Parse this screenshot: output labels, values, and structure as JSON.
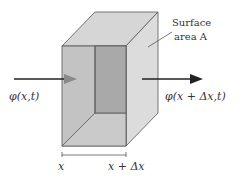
{
  "diagram": {
    "labels": {
      "surface_line1": "Surface",
      "surface_line2": "area A",
      "flux_in": "φ(x,t)",
      "flux_out": "φ(x + Δx,t)",
      "x_left": "x",
      "x_right": "x + Δx"
    },
    "colors": {
      "front_face": "#c3c3c3",
      "inner_panel": "#a9a9a9",
      "top_face": "#d6d6d6",
      "right_face": "#dadada",
      "bottom_floor": "#c9c9c9",
      "edge": "#555555",
      "arrow_dark": "#222222",
      "arrow_in_head": "#8a8a8a"
    }
  }
}
